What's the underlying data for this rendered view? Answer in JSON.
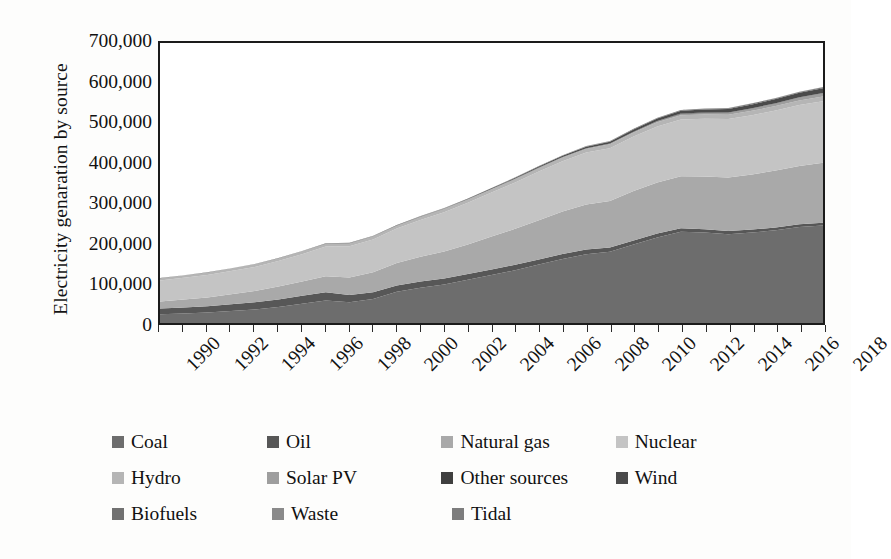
{
  "chart_data": {
    "type": "area",
    "stacked": true,
    "title": "",
    "subtitle": "",
    "xlabel": "",
    "ylabel": "Electricity genaration by source",
    "xlim": [
      1990,
      2018
    ],
    "ylim": [
      0,
      700000
    ],
    "ytick_labels": [
      "0",
      "100,000",
      "200,000",
      "300,000",
      "400,000",
      "500,000",
      "600,000",
      "700,000"
    ],
    "ytick_values": [
      0,
      100000,
      200000,
      300000,
      400000,
      500000,
      600000,
      700000
    ],
    "ytick_step": 100000,
    "grid": false,
    "legend_position": "bottom",
    "x": [
      1990,
      1991,
      1992,
      1993,
      1994,
      1995,
      1996,
      1997,
      1998,
      1999,
      2000,
      2001,
      2002,
      2003,
      2004,
      2005,
      2006,
      2007,
      2008,
      2009,
      2010,
      2011,
      2012,
      2013,
      2014,
      2015,
      2016,
      2017,
      2018
    ],
    "xtick_labels": [
      "1990",
      "1992",
      "1994",
      "1996",
      "1998",
      "2000",
      "2002",
      "2004",
      "2006",
      "2008",
      "2010",
      "2012",
      "2014",
      "2016",
      "2018"
    ],
    "xtick_values": [
      1990,
      1992,
      1994,
      1996,
      1998,
      2000,
      2002,
      2004,
      2006,
      2008,
      2010,
      2012,
      2014,
      2016,
      2018
    ],
    "xtick_rotation": -45,
    "series": [
      {
        "name": "Coal",
        "color": "#6d6d6d",
        "values": [
          22000,
          24000,
          26000,
          30000,
          34000,
          40000,
          48000,
          56000,
          52000,
          60000,
          78000,
          88000,
          96000,
          108000,
          120000,
          132000,
          146000,
          160000,
          172000,
          178000,
          196000,
          214000,
          228000,
          226000,
          222000,
          226000,
          232000,
          240000,
          244000
        ]
      },
      {
        "name": "Oil",
        "color": "#575757",
        "values": [
          14000,
          15000,
          16000,
          17000,
          18000,
          19000,
          20000,
          21000,
          18000,
          17000,
          16000,
          15500,
          15000,
          14500,
          14000,
          13500,
          13000,
          12500,
          12000,
          11000,
          10000,
          9500,
          9000,
          8500,
          8000,
          7500,
          7000,
          6800,
          6600
        ]
      },
      {
        "name": "Natural gas",
        "color": "#a9a9a9",
        "values": [
          18000,
          20000,
          22000,
          25000,
          28000,
          32000,
          36000,
          40000,
          44000,
          50000,
          56000,
          62000,
          68000,
          74000,
          82000,
          90000,
          98000,
          106000,
          112000,
          116000,
          124000,
          128000,
          130000,
          132000,
          134000,
          138000,
          142000,
          146000,
          150000
        ]
      },
      {
        "name": "Nuclear",
        "color": "#c4c4c4",
        "values": [
          52000,
          54000,
          56000,
          58000,
          60000,
          64000,
          68000,
          74000,
          78000,
          82000,
          86000,
          92000,
          98000,
          104000,
          110000,
          116000,
          122000,
          126000,
          130000,
          132000,
          136000,
          140000,
          142000,
          144000,
          146000,
          148000,
          150000,
          152000,
          154000
        ]
      },
      {
        "name": "Hydro",
        "color": "#b5b5b5",
        "values": [
          6000,
          6200,
          6400,
          6600,
          6800,
          7000,
          7200,
          7400,
          7600,
          7800,
          8000,
          8200,
          8400,
          8600,
          8800,
          9000,
          9200,
          9400,
          9600,
          9800,
          10000,
          10200,
          10400,
          10600,
          10800,
          11000,
          11200,
          11400,
          11600
        ]
      },
      {
        "name": "Solar PV",
        "color": "#9e9e9e",
        "values": [
          0,
          0,
          0,
          0,
          0,
          0,
          0,
          0,
          0,
          0,
          0,
          0,
          0,
          0,
          0,
          100,
          200,
          400,
          800,
          1200,
          1800,
          2500,
          3400,
          4200,
          5000,
          5800,
          6600,
          7400,
          8200
        ]
      },
      {
        "name": "Other sources",
        "color": "#3f3f3f",
        "values": [
          200,
          220,
          240,
          260,
          280,
          300,
          320,
          340,
          360,
          380,
          400,
          420,
          440,
          460,
          480,
          500,
          520,
          540,
          560,
          580,
          600,
          620,
          640,
          660,
          680,
          700,
          720,
          740,
          760
        ]
      },
      {
        "name": "Wind",
        "color": "#4a4a4a",
        "values": [
          0,
          0,
          0,
          0,
          0,
          0,
          0,
          100,
          150,
          200,
          300,
          400,
          600,
          900,
          1300,
          1800,
          2400,
          3000,
          3800,
          4600,
          5400,
          6200,
          7000,
          7800,
          8600,
          9400,
          10200,
          11000,
          11800
        ]
      },
      {
        "name": "Biofuels",
        "color": "#717171",
        "values": [
          100,
          120,
          140,
          160,
          180,
          200,
          240,
          280,
          320,
          380,
          440,
          520,
          600,
          700,
          800,
          920,
          1040,
          1160,
          1280,
          1400,
          1520,
          1640,
          1760,
          1880,
          2000,
          2120,
          2240,
          2360,
          2480
        ]
      },
      {
        "name": "Waste",
        "color": "#8a8a8a",
        "values": [
          50,
          55,
          60,
          65,
          70,
          80,
          90,
          100,
          110,
          125,
          140,
          160,
          180,
          200,
          220,
          245,
          270,
          300,
          330,
          360,
          390,
          420,
          450,
          480,
          510,
          540,
          570,
          600,
          630
        ]
      },
      {
        "name": "Tidal",
        "color": "#7d7d7d",
        "values": [
          10,
          10,
          10,
          10,
          10,
          10,
          10,
          10,
          10,
          10,
          10,
          10,
          10,
          10,
          10,
          10,
          10,
          10,
          10,
          10,
          10,
          10,
          10,
          10,
          10,
          10,
          10,
          10,
          10
        ]
      }
    ],
    "totals": [
      112360,
      119595,
      126890,
      137095,
      147340,
      162590,
      180060,
      199620,
      200550,
      218885,
      247090,
      268800,
      289670,
      311430,
      338390,
      364095,
      392640,
      419310,
      442340,
      454930,
      485720,
      513112,
      532670,
      535130,
      537600,
      550080,
      562552,
      577314,
      590080
    ]
  },
  "axis": {
    "y_title": "Electricity genaration by source"
  },
  "legend": {
    "rows": [
      [
        {
          "label": "Coal",
          "color": "#6d6d6d"
        },
        {
          "label": "Oil",
          "color": "#575757"
        },
        {
          "label": "Natural gas",
          "color": "#a9a9a9"
        },
        {
          "label": "Nuclear",
          "color": "#c4c4c4"
        }
      ],
      [
        {
          "label": "Hydro",
          "color": "#b5b5b5"
        },
        {
          "label": "Solar PV",
          "color": "#9e9e9e"
        },
        {
          "label": "Other sources",
          "color": "#3f3f3f"
        },
        {
          "label": "Wind",
          "color": "#4a4a4a"
        }
      ],
      [
        {
          "label": "Biofuels",
          "color": "#717171"
        },
        {
          "label": "Waste",
          "color": "#8a8a8a"
        },
        {
          "label": "Tidal",
          "color": "#7d7d7d"
        }
      ]
    ]
  }
}
